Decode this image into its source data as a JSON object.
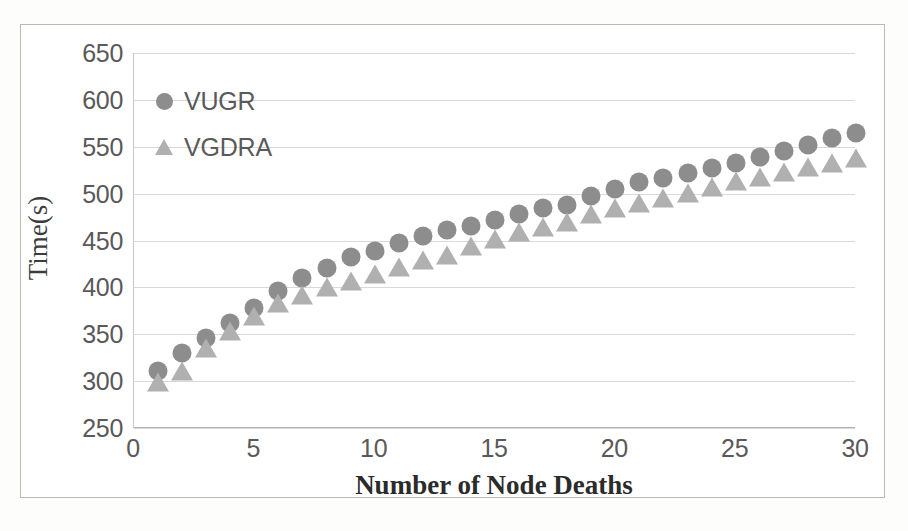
{
  "chart_data": {
    "type": "scatter",
    "title": "",
    "xlabel": "Number of Node Deaths",
    "ylabel": "Time(s)",
    "xlim": [
      0,
      30
    ],
    "ylim": [
      250,
      650
    ],
    "xticks": [
      0,
      5,
      10,
      15,
      20,
      25,
      30
    ],
    "yticks": [
      250,
      300,
      350,
      400,
      450,
      500,
      550,
      600,
      650
    ],
    "grid": true,
    "legend_position": "upper-left-inside",
    "x": [
      1,
      2,
      3,
      4,
      5,
      6,
      7,
      8,
      9,
      10,
      11,
      12,
      13,
      14,
      15,
      16,
      17,
      18,
      19,
      20,
      21,
      22,
      23,
      24,
      25,
      26,
      27,
      28,
      29,
      30
    ],
    "series": [
      {
        "name": "VUGR",
        "marker": "circle",
        "color": "#8d8d8d",
        "values": [
          311,
          330,
          346,
          362,
          378,
          396,
          410,
          421,
          432,
          439,
          447,
          455,
          461,
          466,
          472,
          478,
          485,
          488,
          498,
          505,
          512,
          517,
          522,
          527,
          533,
          539,
          546,
          552,
          559,
          565
        ]
      },
      {
        "name": "VGDRA",
        "marker": "triangle",
        "color": "#b0b0b0",
        "values": [
          298,
          310,
          334,
          352,
          368,
          382,
          391,
          399,
          406,
          413,
          421,
          428,
          434,
          443,
          451,
          458,
          463,
          469,
          477,
          484,
          489,
          494,
          500,
          506,
          512,
          517,
          522,
          527,
          532,
          537
        ]
      }
    ]
  },
  "legend": {
    "items": [
      {
        "label": "VUGR",
        "marker": "circle"
      },
      {
        "label": "VGDRA",
        "marker": "triangle"
      }
    ]
  },
  "axes": {
    "y_title": "Time(s)",
    "x_title": "Number of Node Deaths",
    "y_tick_labels": [
      "650",
      "600",
      "550",
      "500",
      "450",
      "400",
      "350",
      "300",
      "250"
    ],
    "x_tick_labels": [
      "0",
      "5",
      "10",
      "15",
      "20",
      "25",
      "30"
    ]
  }
}
